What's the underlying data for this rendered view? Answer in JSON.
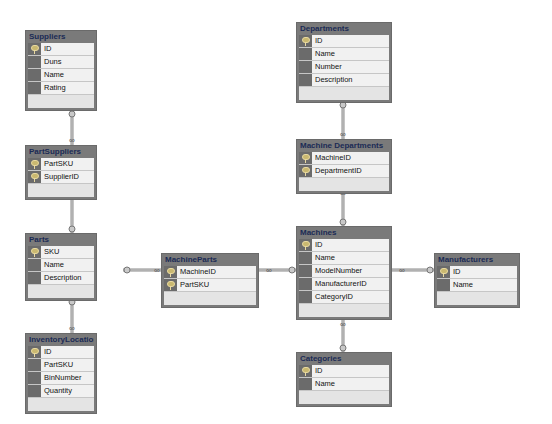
{
  "diagram": {
    "tables": [
      {
        "id": "suppliers",
        "name": "Suppliers",
        "x": 25,
        "y": 30,
        "w": 72,
        "columns": [
          {
            "name": "ID",
            "pk": true
          },
          {
            "name": "Duns",
            "pk": false
          },
          {
            "name": "Name",
            "pk": false
          },
          {
            "name": "Rating",
            "pk": false
          }
        ]
      },
      {
        "id": "partsuppliers",
        "name": "PartSuppliers",
        "x": 25,
        "y": 145,
        "w": 72,
        "columns": [
          {
            "name": "PartSKU",
            "pk": true
          },
          {
            "name": "SupplierID",
            "pk": true
          }
        ]
      },
      {
        "id": "parts",
        "name": "Parts",
        "x": 25,
        "y": 233,
        "w": 72,
        "columns": [
          {
            "name": "SKU",
            "pk": true
          },
          {
            "name": "Name",
            "pk": false
          },
          {
            "name": "Description",
            "pk": false
          }
        ]
      },
      {
        "id": "inventorylocations",
        "name": "InventoryLocations",
        "x": 25,
        "y": 333,
        "w": 72,
        "columns": [
          {
            "name": "ID",
            "pk": true
          },
          {
            "name": "PartSKU",
            "pk": false
          },
          {
            "name": "BinNumber",
            "pk": false
          },
          {
            "name": "Quantity",
            "pk": false
          }
        ]
      },
      {
        "id": "machineparts",
        "name": "MachineParts",
        "x": 161,
        "y": 253,
        "w": 98,
        "columns": [
          {
            "name": "MachineID",
            "pk": true
          },
          {
            "name": "PartSKU",
            "pk": true
          }
        ]
      },
      {
        "id": "departments",
        "name": "Departments",
        "x": 296,
        "y": 22,
        "w": 96,
        "columns": [
          {
            "name": "ID",
            "pk": true
          },
          {
            "name": "Name",
            "pk": false
          },
          {
            "name": "Number",
            "pk": false
          },
          {
            "name": "Description",
            "pk": false
          }
        ]
      },
      {
        "id": "machinedepartments",
        "name": "Machine Departments",
        "x": 296,
        "y": 139,
        "w": 96,
        "columns": [
          {
            "name": "MachineID",
            "pk": true
          },
          {
            "name": "DepartmentID",
            "pk": true
          }
        ]
      },
      {
        "id": "machines",
        "name": "Machines",
        "x": 296,
        "y": 226,
        "w": 96,
        "columns": [
          {
            "name": "ID",
            "pk": true
          },
          {
            "name": "Name",
            "pk": false
          },
          {
            "name": "ModelNumber",
            "pk": false
          },
          {
            "name": "ManufacturerID",
            "pk": false
          },
          {
            "name": "CategoryID",
            "pk": false
          }
        ]
      },
      {
        "id": "categories",
        "name": "Categories",
        "x": 296,
        "y": 352,
        "w": 96,
        "columns": [
          {
            "name": "ID",
            "pk": true
          },
          {
            "name": "Name",
            "pk": false
          }
        ]
      },
      {
        "id": "manufacturers",
        "name": "Manufacturers",
        "x": 434,
        "y": 253,
        "w": 86,
        "columns": [
          {
            "name": "ID",
            "pk": true
          },
          {
            "name": "Name",
            "pk": false
          }
        ]
      }
    ],
    "relationships": [
      {
        "from": "suppliers",
        "to": "partsuppliers",
        "points": [
          [
            72,
            110
          ],
          [
            72,
            145
          ]
        ]
      },
      {
        "from": "parts",
        "to": "partsuppliers",
        "points": [
          [
            72,
            233
          ],
          [
            72,
            193
          ]
        ]
      },
      {
        "from": "parts",
        "to": "inventorylocations",
        "points": [
          [
            72,
            298
          ],
          [
            72,
            333
          ]
        ]
      },
      {
        "from": "parts",
        "to": "machineparts",
        "points": [
          [
            123,
            270
          ],
          [
            161,
            270
          ]
        ]
      },
      {
        "from": "machines",
        "to": "machineparts",
        "points": [
          [
            296,
            270
          ],
          [
            259,
            270
          ]
        ]
      },
      {
        "from": "departments",
        "to": "machinedepartments",
        "points": [
          [
            343,
            101
          ],
          [
            343,
            139
          ]
        ]
      },
      {
        "from": "machines",
        "to": "machinedepartments",
        "points": [
          [
            343,
            226
          ],
          [
            343,
            188
          ]
        ]
      },
      {
        "from": "categories",
        "to": "machines",
        "points": [
          [
            343,
            352
          ],
          [
            343,
            319
          ]
        ]
      },
      {
        "from": "manufacturers",
        "to": "machines",
        "points": [
          [
            434,
            270
          ],
          [
            392,
            270
          ]
        ]
      }
    ],
    "colors": {
      "header": "#7a7a7a",
      "title_text": "#1a2a55",
      "row_bg": "#f1f1f1",
      "gutter": "#6b6b6b",
      "line": "#8a8a8a"
    }
  }
}
